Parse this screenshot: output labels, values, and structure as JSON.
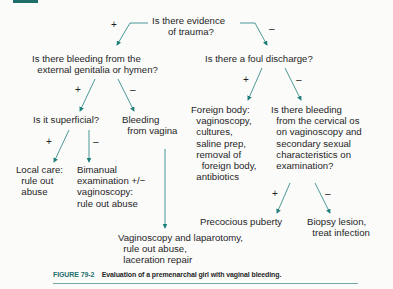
{
  "header": {
    "block_color": "#1e6f6c"
  },
  "flowchart": {
    "accent_color": "#1e7f7b",
    "nodes": {
      "trauma": "Is there evidence\n      of trauma?",
      "bleeding_external": "Is there bleeding from the\n  external genitalia or hymen?",
      "foul_discharge": "Is there a foul discharge?",
      "superficial": "Is it superficial?",
      "bleeding_vagina": "Bleeding\n  from vagina",
      "local_care": "Local care:\n  rule out\n  abuse",
      "bimanual": "Bimanual\nexamination +/−\nvaginoscopy:\nrule out abuse",
      "foreign_body": "Foreign body:\n  vaginoscopy,\n  cultures,\n  saline prep,\n  removal of\n    foreign body,\n  antibiotics",
      "cervical_os": "Is there bleeding\n  from the cervical os\n  on vaginoscopy and\n  secondary sexual\n  characteristics on\n  examination?",
      "vaginoscopy_laparotomy": "Vaginoscopy and laparotomy,\n  rule out abuse,\n  laceration repair",
      "precocious_puberty": "Precocious puberty",
      "biopsy": "Biopsy lesion,\n  treat infection"
    },
    "signs": {
      "plus": "+",
      "minus": "–"
    }
  },
  "caption": {
    "label": "FIGURE 79-2",
    "text": "Evaluation of a premenarchal girl with vaginal bleeding."
  }
}
